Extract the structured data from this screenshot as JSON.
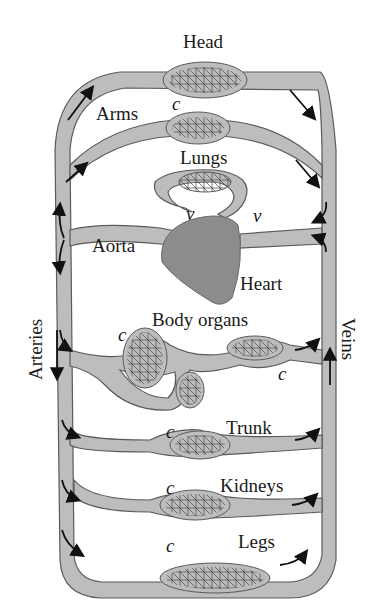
{
  "diagram": {
    "type": "circulatory-system-schematic",
    "colors": {
      "vessel_fill": "#bdbdbd",
      "vessel_stroke": "#5a5a5a",
      "heart_fill": "#8c8c8c",
      "capillary_line": "#555555",
      "arrow": "#111111",
      "text": "#1a1a1a"
    },
    "labels": {
      "head": "Head",
      "arms": "Arms",
      "lungs": "Lungs",
      "aorta": "Aorta",
      "heart": "Heart",
      "arteries": "Arteries",
      "veins": "Veins",
      "body_organs": "Body organs",
      "trunk": "Trunk",
      "kidneys": "Kidneys",
      "legs": "Legs"
    },
    "markers": {
      "capillary": "c",
      "valve": "v"
    },
    "circuits": [
      "Head",
      "Arms",
      "Lungs",
      "Body organs",
      "Trunk",
      "Kidneys",
      "Legs"
    ]
  }
}
